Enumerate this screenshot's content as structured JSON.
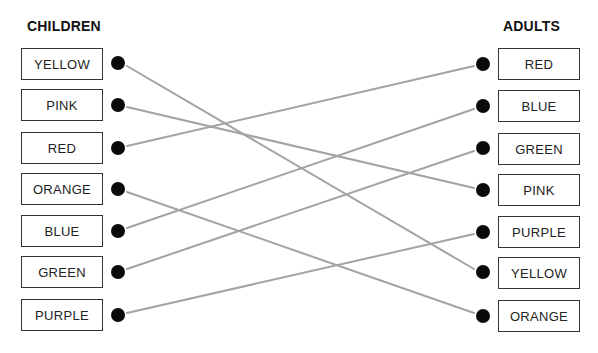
{
  "diagram": {
    "left_heading": "CHILDREN",
    "right_heading": "ADULTS",
    "line_color": "#a3a3a3",
    "dot_color": "#0a0a0a",
    "children": [
      {
        "label": "YELLOW",
        "rank": 1
      },
      {
        "label": "PINK",
        "rank": 2
      },
      {
        "label": "RED",
        "rank": 3
      },
      {
        "label": "ORANGE",
        "rank": 4
      },
      {
        "label": "BLUE",
        "rank": 5
      },
      {
        "label": "GREEN",
        "rank": 6
      },
      {
        "label": "PURPLE",
        "rank": 7
      }
    ],
    "adults": [
      {
        "label": "RED",
        "rank": 1
      },
      {
        "label": "BLUE",
        "rank": 2
      },
      {
        "label": "GREEN",
        "rank": 3
      },
      {
        "label": "PINK",
        "rank": 4
      },
      {
        "label": "PURPLE",
        "rank": 5
      },
      {
        "label": "YELLOW",
        "rank": 6
      },
      {
        "label": "ORANGE",
        "rank": 7
      }
    ],
    "connections": [
      {
        "color": "YELLOW",
        "children_rank": 1,
        "adults_rank": 6
      },
      {
        "color": "PINK",
        "children_rank": 2,
        "adults_rank": 4
      },
      {
        "color": "RED",
        "children_rank": 3,
        "adults_rank": 1
      },
      {
        "color": "ORANGE",
        "children_rank": 4,
        "adults_rank": 7
      },
      {
        "color": "BLUE",
        "children_rank": 5,
        "adults_rank": 2
      },
      {
        "color": "GREEN",
        "children_rank": 6,
        "adults_rank": 3
      },
      {
        "color": "PURPLE",
        "children_rank": 7,
        "adults_rank": 5
      }
    ]
  }
}
